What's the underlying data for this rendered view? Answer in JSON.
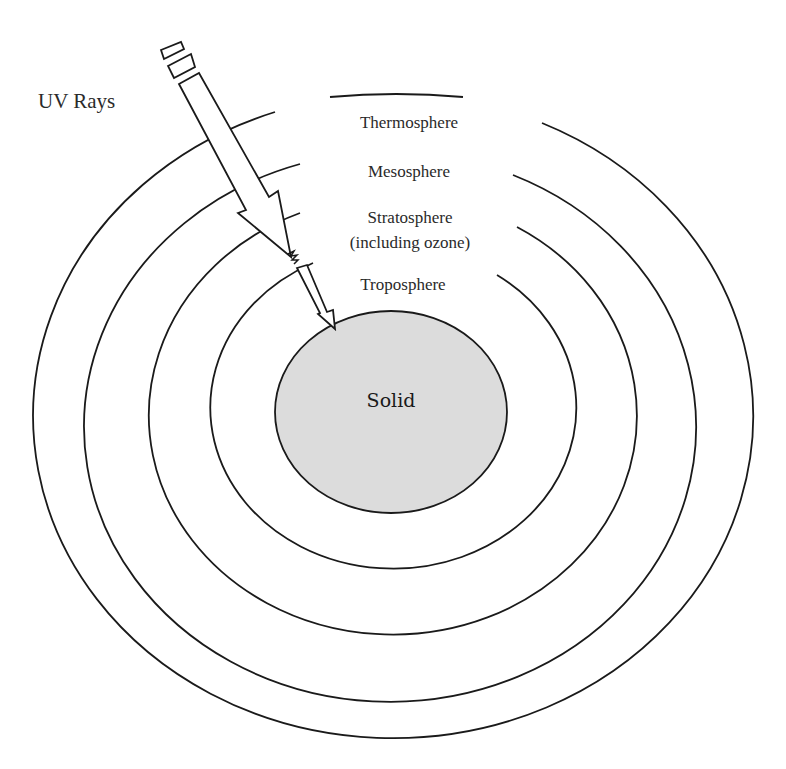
{
  "diagram": {
    "title_fragment": "...y ... g ... p p...",
    "arrow_label": "UV Rays",
    "layers": [
      {
        "name": "Thermosphere",
        "lines": [
          "Thermosphere"
        ]
      },
      {
        "name": "Mesosphere",
        "lines": [
          "Mesosphere"
        ]
      },
      {
        "name": "Stratosphere",
        "lines": [
          "Stratosphere",
          "(including ozone)"
        ]
      },
      {
        "name": "Troposphere",
        "lines": [
          "Troposphere"
        ]
      }
    ],
    "core_label": "Solid",
    "colors": {
      "line": "#1a1a1a",
      "core_fill": "#dcdcdc",
      "background": "#ffffff"
    }
  }
}
